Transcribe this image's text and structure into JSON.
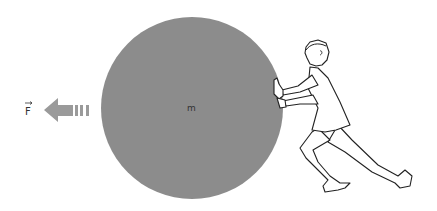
{
  "figure": {
    "force_label": "F",
    "mass_label": "m",
    "colors": {
      "ball": "#8c8c8c",
      "arrow": "#9a9a9a",
      "line": "#222222"
    }
  }
}
